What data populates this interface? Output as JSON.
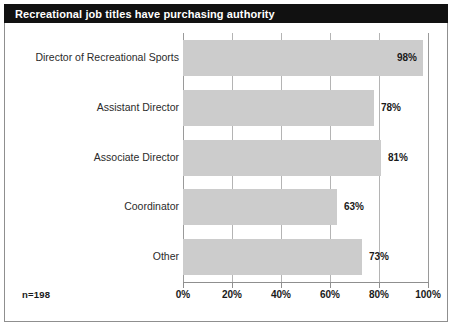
{
  "title": "Recreational job titles have purchasing authority",
  "sample_note": "n=198",
  "colors": {
    "title_bar_background": "#111111",
    "title_text": "#ffffff",
    "bar_fill": "#cccccc",
    "gridline": "#b4b4b4",
    "axis_line": "#8f8f8f",
    "frame_border": "#8f8f8f",
    "label_text": "#2b2b2b",
    "value_text": "#1a1a1a",
    "plot_background": "#ffffff"
  },
  "chart_data": {
    "type": "bar",
    "orientation": "horizontal",
    "title": "Recreational job titles have purchasing authority",
    "categories": [
      "Director of Recreational Sports",
      "Assistant Director",
      "Associate Director",
      "Coordinator",
      "Other"
    ],
    "values": [
      98,
      78,
      81,
      63,
      73
    ],
    "value_labels": [
      "98%",
      "78%",
      "81%",
      "63%",
      "73%"
    ],
    "label_position": [
      "inside",
      "outside",
      "outside",
      "outside",
      "outside"
    ],
    "xlabel": "",
    "ylabel": "",
    "xlim": [
      0,
      100
    ],
    "xticks": [
      0,
      20,
      40,
      60,
      80,
      100
    ],
    "xtick_labels": [
      "0%",
      "20%",
      "40%",
      "60%",
      "80%",
      "100%"
    ],
    "grid": "vertical",
    "legend": "none",
    "annotation": "n=198",
    "units": "percent"
  }
}
